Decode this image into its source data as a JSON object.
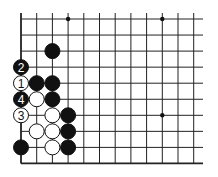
{
  "board": {
    "cols": 12,
    "rows": 10,
    "edges": [
      "left",
      "bottom"
    ],
    "star_points": [
      [
        3,
        0
      ],
      [
        9,
        0
      ],
      [
        9,
        6
      ]
    ],
    "stones": [
      {
        "col": 2,
        "row": 2,
        "color": "black",
        "label": ""
      },
      {
        "col": 0,
        "row": 3,
        "color": "black",
        "label": "2"
      },
      {
        "col": 0,
        "row": 4,
        "color": "white",
        "label": "1"
      },
      {
        "col": 1,
        "row": 4,
        "color": "black",
        "label": ""
      },
      {
        "col": 2,
        "row": 4,
        "color": "black",
        "label": ""
      },
      {
        "col": 0,
        "row": 5,
        "color": "black",
        "label": "4"
      },
      {
        "col": 1,
        "row": 5,
        "color": "white",
        "label": ""
      },
      {
        "col": 2,
        "row": 5,
        "color": "black",
        "label": ""
      },
      {
        "col": 0,
        "row": 6,
        "color": "white",
        "label": "3"
      },
      {
        "col": 2,
        "row": 6,
        "color": "white",
        "label": ""
      },
      {
        "col": 3,
        "row": 6,
        "color": "black",
        "label": ""
      },
      {
        "col": 1,
        "row": 7,
        "color": "white",
        "label": ""
      },
      {
        "col": 2,
        "row": 7,
        "color": "white",
        "label": ""
      },
      {
        "col": 3,
        "row": 7,
        "color": "black",
        "label": ""
      },
      {
        "col": 0,
        "row": 8,
        "color": "black",
        "label": ""
      },
      {
        "col": 2,
        "row": 8,
        "color": "white",
        "label": ""
      },
      {
        "col": 3,
        "row": 8,
        "color": "black",
        "label": ""
      }
    ]
  }
}
